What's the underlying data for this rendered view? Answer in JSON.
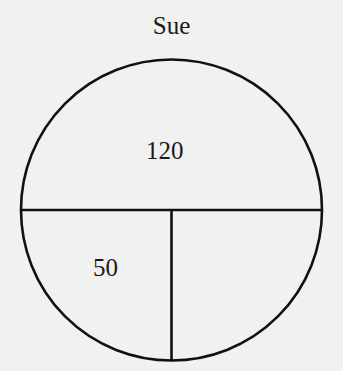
{
  "diagram": {
    "title": "Sue",
    "sections": [
      {
        "name": "top-half",
        "label": "120"
      },
      {
        "name": "bottom-left-quarter",
        "label": "50"
      },
      {
        "name": "bottom-right-quarter",
        "label": ""
      }
    ],
    "colors": {
      "background": "#f1f1f1",
      "stroke": "#111111",
      "text": "#1a1a1a"
    }
  }
}
